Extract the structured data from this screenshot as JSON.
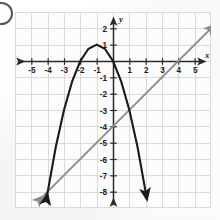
{
  "figure": {
    "bullet_marker": "answer-choice-bullet",
    "axis_labels": {
      "x": "x",
      "y": "y"
    }
  },
  "chart_data": {
    "type": "line",
    "title": "",
    "xlabel": "x",
    "ylabel": "y",
    "grid": true,
    "legend_position": "none",
    "xlim": [
      -6,
      6
    ],
    "ylim": [
      -9,
      3
    ],
    "x_ticks": [
      -5,
      -4,
      -3,
      -2,
      -1,
      1,
      2,
      3,
      4,
      5
    ],
    "x_tick_labels": [
      "-5",
      "-4",
      "-3",
      "-2",
      "-1",
      "1",
      "2",
      "3",
      "4",
      "5"
    ],
    "y_ticks": [
      2,
      1,
      -1,
      -2,
      -3,
      -4,
      -5,
      -6,
      -7,
      -8
    ],
    "y_tick_labels": [
      "2",
      "1",
      "-1",
      "-2",
      "-3",
      "-4",
      "-5",
      "-6",
      "-7",
      "-8"
    ],
    "series": [
      {
        "name": "parabola",
        "kind": "quadratic",
        "equation": "y = -x^2 - 2x",
        "color": "#1a1a1a",
        "vertex": [
          -1,
          1
        ],
        "x_intercepts": [
          -2,
          0
        ],
        "y_intercept": 0,
        "opens": "down",
        "arrow_ends": "both",
        "points": [
          [
            -4.05,
            -8.3
          ],
          [
            -3.5,
            -5.25
          ],
          [
            -3,
            -3
          ],
          [
            -2.5,
            -1.25
          ],
          [
            -2,
            0
          ],
          [
            -1.5,
            0.75
          ],
          [
            -1,
            1
          ],
          [
            -0.5,
            0.75
          ],
          [
            0,
            0
          ],
          [
            0.5,
            -1.25
          ],
          [
            1,
            -3
          ],
          [
            1.5,
            -5.25
          ],
          [
            2.05,
            -8.3
          ]
        ]
      },
      {
        "name": "line",
        "kind": "linear",
        "equation": "y = x - 4",
        "color": "#8d8d8d",
        "slope": 1,
        "y_intercept": -4,
        "x_intercept": 4,
        "arrow_ends": "both",
        "points": [
          [
            -4.4,
            -8.4
          ],
          [
            6.1,
            2.1
          ]
        ]
      }
    ],
    "intersections": [
      [
        1,
        -3
      ]
    ]
  }
}
